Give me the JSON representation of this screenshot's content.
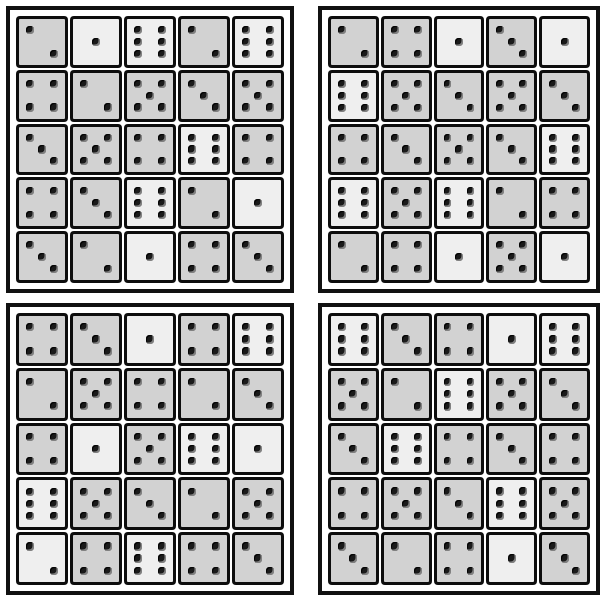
{
  "page": {
    "width": 606,
    "height": 604,
    "background_color": "#ffffff"
  },
  "style": {
    "panel_border_color": "#111111",
    "die_border_color": "#0d0d0d",
    "die_face_color": "#d2d2d2",
    "die_face_light_color": "#efefef",
    "pip_color": "#1a1a1a"
  },
  "panels": [
    {
      "id": "panel-top-left",
      "name": "top-left-dice-grid",
      "x": 6,
      "y": 6,
      "width": 288,
      "height": 287,
      "rows": 5,
      "cols": 5,
      "values": [
        [
          2,
          1,
          6,
          2,
          6
        ],
        [
          4,
          2,
          5,
          3,
          5
        ],
        [
          3,
          5,
          4,
          6,
          4
        ],
        [
          4,
          3,
          6,
          2,
          1
        ],
        [
          3,
          2,
          1,
          4,
          3
        ]
      ],
      "light_faces": [
        [
          false,
          true,
          true,
          false,
          true
        ],
        [
          false,
          false,
          false,
          false,
          false
        ],
        [
          false,
          false,
          false,
          true,
          false
        ],
        [
          false,
          false,
          true,
          false,
          true
        ],
        [
          false,
          false,
          true,
          false,
          false
        ]
      ]
    },
    {
      "id": "panel-top-right",
      "name": "top-right-dice-grid",
      "x": 318,
      "y": 6,
      "width": 282,
      "height": 287,
      "rows": 5,
      "cols": 5,
      "values": [
        [
          2,
          4,
          1,
          3,
          1
        ],
        [
          6,
          5,
          3,
          5,
          3
        ],
        [
          4,
          3,
          5,
          3,
          6
        ],
        [
          6,
          5,
          6,
          2,
          4
        ],
        [
          2,
          4,
          1,
          5,
          1
        ]
      ],
      "light_faces": [
        [
          false,
          false,
          true,
          false,
          true
        ],
        [
          true,
          false,
          false,
          false,
          false
        ],
        [
          false,
          false,
          false,
          false,
          true
        ],
        [
          true,
          false,
          true,
          false,
          false
        ],
        [
          false,
          false,
          true,
          false,
          true
        ]
      ]
    },
    {
      "id": "panel-bottom-left",
      "name": "bottom-left-dice-grid",
      "x": 6,
      "y": 303,
      "width": 288,
      "height": 292,
      "rows": 5,
      "cols": 5,
      "values": [
        [
          4,
          3,
          1,
          4,
          6
        ],
        [
          2,
          5,
          4,
          2,
          3
        ],
        [
          4,
          1,
          5,
          6,
          1
        ],
        [
          6,
          5,
          3,
          2,
          5
        ],
        [
          2,
          4,
          6,
          4,
          3
        ]
      ],
      "light_faces": [
        [
          false,
          false,
          true,
          false,
          true
        ],
        [
          false,
          false,
          false,
          false,
          false
        ],
        [
          false,
          true,
          false,
          true,
          true
        ],
        [
          true,
          false,
          false,
          false,
          false
        ],
        [
          true,
          false,
          true,
          false,
          false
        ]
      ]
    },
    {
      "id": "panel-bottom-right",
      "name": "bottom-right-dice-grid",
      "x": 318,
      "y": 303,
      "width": 282,
      "height": 292,
      "rows": 5,
      "cols": 5,
      "values": [
        [
          6,
          3,
          4,
          1,
          6
        ],
        [
          5,
          2,
          6,
          5,
          3
        ],
        [
          3,
          6,
          4,
          3,
          4
        ],
        [
          4,
          5,
          3,
          6,
          5
        ],
        [
          3,
          2,
          4,
          1,
          3
        ]
      ],
      "light_faces": [
        [
          true,
          false,
          false,
          true,
          true
        ],
        [
          false,
          false,
          true,
          false,
          false
        ],
        [
          false,
          true,
          false,
          false,
          false
        ],
        [
          false,
          false,
          false,
          true,
          false
        ],
        [
          false,
          false,
          false,
          true,
          false
        ]
      ]
    }
  ],
  "pip_layouts": {
    "1": [
      "p-mc"
    ],
    "2": [
      "p-tl",
      "p-br"
    ],
    "3": [
      "p-tl",
      "p-mc",
      "p-br"
    ],
    "4": [
      "p-tl",
      "p-tr",
      "p-bl",
      "p-br"
    ],
    "5": [
      "p-tl",
      "p-tr",
      "p-mc",
      "p-bl",
      "p-br"
    ],
    "6": [
      "p-tl",
      "p-tr",
      "p-ml",
      "p-mr",
      "p-bl",
      "p-br"
    ]
  }
}
